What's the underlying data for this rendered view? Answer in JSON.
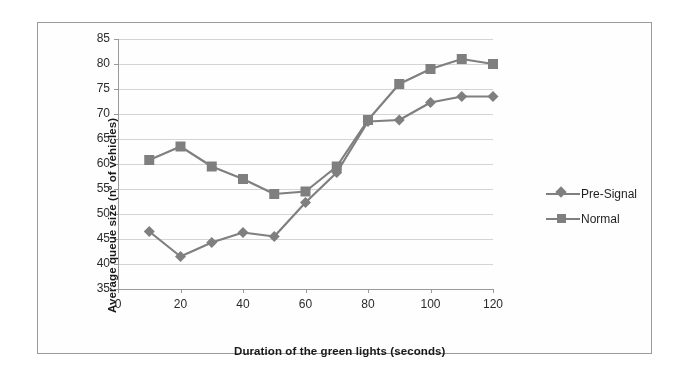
{
  "chart_data": {
    "type": "line",
    "title": "",
    "xlabel": "Duration of the green lights (seconds)",
    "ylabel": "Average queue size (nº of vehicles)",
    "x": [
      10,
      20,
      30,
      40,
      50,
      60,
      70,
      80,
      90,
      100,
      110,
      120
    ],
    "series": [
      {
        "name": "Pre-Signal",
        "marker": "diamond",
        "color": "#7f7f7f",
        "values": [
          46.5,
          41.5,
          44.3,
          46.3,
          45.5,
          52.3,
          58.3,
          68.5,
          68.8,
          72.3,
          73.5,
          73.5
        ]
      },
      {
        "name": "Normal",
        "marker": "square",
        "color": "#7f7f7f",
        "values": [
          60.8,
          63.5,
          59.5,
          57.0,
          54.0,
          54.5,
          59.5,
          68.8,
          76.0,
          79.0,
          81.0,
          80.0
        ]
      }
    ],
    "xlim": [
      0,
      120
    ],
    "ylim": [
      35,
      85
    ],
    "xticks": [
      "0",
      "20",
      "40",
      "60",
      "80",
      "100",
      "120"
    ],
    "yticks": [
      "85",
      "80",
      "75",
      "70",
      "65",
      "60",
      "55",
      "50",
      "45",
      "40",
      "35"
    ],
    "grid": true,
    "grid_color": "#d4d4d4",
    "axis_color": "#9a9a9a",
    "legend_position": "right",
    "legend": [
      "Pre-Signal",
      "Normal"
    ]
  },
  "figure": {
    "border_color": "#9a9a9a",
    "background": "#fefefe"
  }
}
